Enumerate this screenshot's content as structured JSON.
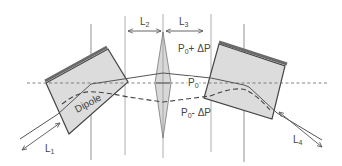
{
  "diagram": {
    "labels": {
      "L1": {
        "main": "L",
        "sub": "1"
      },
      "L2": {
        "main": "L",
        "sub": "2"
      },
      "L3": {
        "main": "L",
        "sub": "3"
      },
      "L4": {
        "main": "L",
        "sub": "4"
      },
      "dipole": "Dipole",
      "p_plus": {
        "main": "P",
        "sub": "0",
        "suffix": "+ ΔP"
      },
      "p_nominal": {
        "main": "P",
        "sub": "0"
      },
      "p_minus": {
        "main": "P",
        "sub": "0",
        "suffix": "- ΔP"
      }
    },
    "colors": {
      "dipole_fill": "#dcdcdc",
      "dipole_edge": "#444444",
      "dipole_top_bar": "#6a6a6a",
      "line": "#555555",
      "lens_fill": "#d8d8d8"
    },
    "components": [
      {
        "name": "left-dipole",
        "type": "dipole"
      },
      {
        "name": "lens",
        "type": "focusing-element"
      },
      {
        "name": "right-dipole",
        "type": "dipole"
      }
    ],
    "trajectories": [
      {
        "name": "P0 + ΔP",
        "style": "solid"
      },
      {
        "name": "P0",
        "style": "dashed-fine"
      },
      {
        "name": "P0 - ΔP",
        "style": "dashed"
      }
    ]
  }
}
